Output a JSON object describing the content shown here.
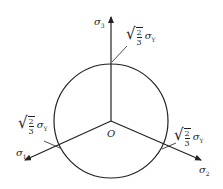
{
  "diagram": {
    "title": "",
    "origin_label": "O",
    "axes": [
      {
        "name": "sigma-3",
        "label_symbol": "σ",
        "label_subscript": "3",
        "direction": "up"
      },
      {
        "name": "sigma-1",
        "label_symbol": "σ",
        "label_subscript": "1",
        "direction": "down-left"
      },
      {
        "name": "sigma-2",
        "label_symbol": "σ",
        "label_subscript": "2",
        "direction": "down-right"
      }
    ],
    "radius_annotations": [
      {
        "position": "top",
        "sqrt_num": "2",
        "sqrt_den": "3",
        "symbol": "σ",
        "subscript": "Y"
      },
      {
        "position": "left",
        "sqrt_num": "2",
        "sqrt_den": "3",
        "symbol": "σ",
        "subscript": "Y"
      },
      {
        "position": "right",
        "sqrt_num": "2",
        "sqrt_den": "3",
        "symbol": "σ",
        "subscript": "Y"
      }
    ],
    "colors": {
      "stroke": "#222222",
      "background": "#ffffff"
    }
  }
}
